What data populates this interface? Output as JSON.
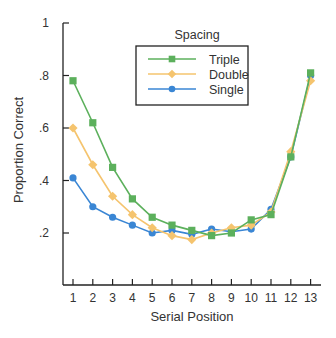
{
  "chart_data": {
    "type": "line",
    "title": "",
    "xlabel": "Serial Position",
    "ylabel": "Proportion Correct",
    "x": [
      1,
      2,
      3,
      4,
      5,
      6,
      7,
      8,
      9,
      10,
      11,
      12,
      13
    ],
    "x_tick_labels": [
      "1",
      "2",
      "3",
      "4",
      "5",
      "6",
      "7",
      "8",
      "9",
      "10",
      "11",
      "12",
      "13"
    ],
    "y_ticks": [
      0.2,
      0.4,
      0.6,
      0.8,
      1.0
    ],
    "y_tick_labels": [
      ".2",
      ".4",
      ".6",
      ".8",
      "1"
    ],
    "ylim": [
      0.1,
      1.0
    ],
    "grid": false,
    "legend": {
      "title": "Spacing",
      "position": "upper center (inside plot)",
      "entries": [
        "Triple",
        "Double",
        "Single"
      ]
    },
    "series": [
      {
        "name": "Triple",
        "color": "#5cb05c",
        "marker": "square",
        "values": [
          0.78,
          0.62,
          0.45,
          0.33,
          0.26,
          0.23,
          0.21,
          0.19,
          0.2,
          0.25,
          0.27,
          0.49,
          0.81
        ]
      },
      {
        "name": "Double",
        "color": "#f5c46e",
        "marker": "diamond",
        "values": [
          0.6,
          0.46,
          0.34,
          0.27,
          0.22,
          0.19,
          0.175,
          0.2,
          0.22,
          0.23,
          0.28,
          0.51,
          0.78
        ]
      },
      {
        "name": "Single",
        "color": "#3a86d4",
        "marker": "circle",
        "values": [
          0.41,
          0.3,
          0.26,
          0.23,
          0.2,
          0.21,
          0.195,
          0.215,
          0.205,
          0.215,
          0.29,
          0.49,
          0.8
        ]
      }
    ]
  }
}
